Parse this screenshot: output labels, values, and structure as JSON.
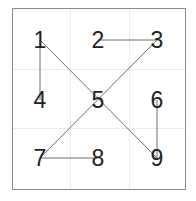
{
  "frame": {
    "x": 12,
    "y": 8,
    "width": 173,
    "height": 181
  },
  "grid": {
    "vertical": [
      70,
      129
    ],
    "horizontal": [
      69,
      128
    ]
  },
  "nodes": [
    {
      "id": "1",
      "label": "1",
      "x": 40,
      "y": 40
    },
    {
      "id": "2",
      "label": "2",
      "x": 98,
      "y": 40
    },
    {
      "id": "3",
      "label": "3",
      "x": 157,
      "y": 40
    },
    {
      "id": "4",
      "label": "4",
      "x": 40,
      "y": 100
    },
    {
      "id": "5",
      "label": "5",
      "x": 98,
      "y": 100
    },
    {
      "id": "6",
      "label": "6",
      "x": 157,
      "y": 100
    },
    {
      "id": "7",
      "label": "7",
      "x": 40,
      "y": 158
    },
    {
      "id": "8",
      "label": "8",
      "x": 98,
      "y": 158
    },
    {
      "id": "9",
      "label": "9",
      "x": 157,
      "y": 158
    }
  ],
  "edges": [
    {
      "from": "1",
      "to": "4"
    },
    {
      "from": "1",
      "to": "9"
    },
    {
      "from": "2",
      "to": "3"
    },
    {
      "from": "3",
      "to": "7"
    },
    {
      "from": "6",
      "to": "9"
    },
    {
      "from": "7",
      "to": "8"
    }
  ],
  "colors": {
    "frame": "#8a8a8a",
    "grid": "#ebebeb",
    "edge": "#6e6e6e",
    "label": "#222222",
    "background": "#ffffff"
  }
}
